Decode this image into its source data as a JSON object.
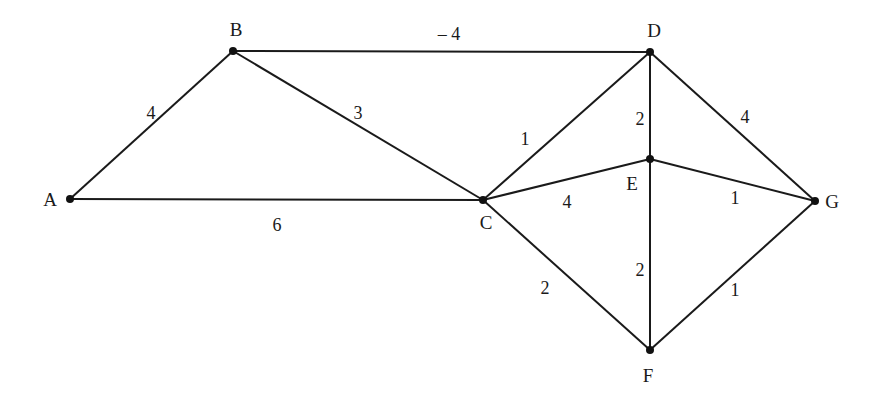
{
  "diagram": {
    "type": "weighted-undirected-graph",
    "colors": {
      "line": "#1a1a1a",
      "node": "#111111",
      "background": "#ffffff"
    },
    "nodes": [
      {
        "id": "A",
        "label": "A",
        "x": 70,
        "y": 199,
        "lx": 50,
        "ly": 206,
        "anchor": "middle"
      },
      {
        "id": "B",
        "label": "B",
        "x": 233,
        "y": 51,
        "lx": 236,
        "ly": 36,
        "anchor": "middle"
      },
      {
        "id": "C",
        "label": "C",
        "x": 483,
        "y": 200,
        "lx": 486,
        "ly": 229,
        "anchor": "middle"
      },
      {
        "id": "D",
        "label": "D",
        "x": 650,
        "y": 52,
        "lx": 654,
        "ly": 37,
        "anchor": "middle"
      },
      {
        "id": "E",
        "label": "E",
        "x": 650,
        "y": 159,
        "lx": 632,
        "ly": 190,
        "anchor": "middle"
      },
      {
        "id": "F",
        "label": "F",
        "x": 650,
        "y": 350,
        "lx": 648,
        "ly": 382,
        "anchor": "middle"
      },
      {
        "id": "G",
        "label": "G",
        "x": 815,
        "y": 201,
        "lx": 832,
        "ly": 208,
        "anchor": "middle"
      }
    ],
    "edges": [
      {
        "from": "A",
        "to": "B",
        "weight": "4",
        "wx": 151,
        "wy": 119
      },
      {
        "from": "A",
        "to": "C",
        "weight": "6",
        "wx": 277,
        "wy": 231
      },
      {
        "from": "B",
        "to": "C",
        "weight": "3",
        "wx": 358,
        "wy": 119
      },
      {
        "from": "B",
        "to": "D",
        "weight": "– 4",
        "wx": 449,
        "wy": 40
      },
      {
        "from": "C",
        "to": "D",
        "weight": "1",
        "wx": 525,
        "wy": 145
      },
      {
        "from": "C",
        "to": "E",
        "weight": "4",
        "wx": 567,
        "wy": 208
      },
      {
        "from": "C",
        "to": "F",
        "weight": "2",
        "wx": 545,
        "wy": 294
      },
      {
        "from": "D",
        "to": "E",
        "weight": "2",
        "wx": 640,
        "wy": 125
      },
      {
        "from": "D",
        "to": "G",
        "weight": "4",
        "wx": 745,
        "wy": 123
      },
      {
        "from": "E",
        "to": "G",
        "weight": "1",
        "wx": 735,
        "wy": 204
      },
      {
        "from": "E",
        "to": "F",
        "weight": "2",
        "wx": 640,
        "wy": 276
      },
      {
        "from": "F",
        "to": "G",
        "weight": "1",
        "wx": 735,
        "wy": 296
      }
    ]
  }
}
